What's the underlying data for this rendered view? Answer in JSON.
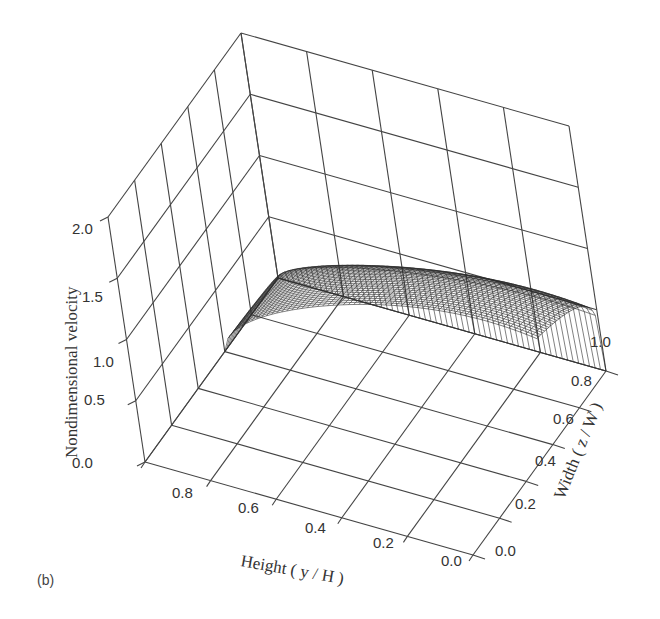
{
  "figure": {
    "panel_label": "(b)",
    "background": "#ffffff",
    "line_color": "#444444",
    "mesh_color": "#2b2b2b"
  },
  "axes": {
    "z": {
      "title": "Nondimensional velocity",
      "ticks": [
        "0.0",
        "0.5",
        "1.0",
        "1.5",
        "2.0"
      ]
    },
    "y": {
      "title": "Height ( y / H )",
      "ticks": [
        "0.8",
        "0.6",
        "0.4",
        "0.2",
        "0.0"
      ]
    },
    "x": {
      "title": "Width ( z / W )",
      "ticks": [
        "0.0",
        "0.2",
        "0.4",
        "0.6",
        "0.8",
        "1.0"
      ]
    }
  },
  "chart_data": {
    "type": "surface3d",
    "title": "",
    "panel_label": "(b)",
    "xlabel": "Height (y/H)",
    "ylabel": "Width (z/W)",
    "zlabel": "Nondimensional velocity",
    "xlim": [
      0.0,
      1.0
    ],
    "ylim": [
      0.0,
      1.0
    ],
    "zlim": [
      0.0,
      2.0
    ],
    "x_ticks": [
      0.0,
      0.2,
      0.4,
      0.6,
      0.8
    ],
    "y_ticks": [
      0.0,
      0.2,
      0.4,
      0.6,
      0.8,
      1.0
    ],
    "z_ticks": [
      0.0,
      0.5,
      1.0,
      1.5,
      2.0
    ],
    "grid": true,
    "surface_extent": {
      "height_range": [
        0.0,
        1.0
      ],
      "width_range": [
        0.6,
        1.0
      ]
    },
    "surface_description": "Wire-mesh velocity profile; velocity is zero at the wall (height = 1.0) and rises to a plateau of about 1.0-1.2 toward height 0; falls steeply to zero at width 1.0 (wall) and stays near 1.0 at width 0.6 (symmetry plane).",
    "sample_profile_along_height_at_width_0_6": {
      "height": [
        1.0,
        0.9,
        0.8,
        0.6,
        0.4,
        0.2,
        0.0
      ],
      "velocity": [
        0.0,
        0.45,
        0.75,
        1.0,
        1.1,
        1.15,
        1.15
      ]
    },
    "sample_profile_along_width_at_height_0_0": {
      "width": [
        0.6,
        0.7,
        0.8,
        0.9,
        0.95,
        1.0
      ],
      "velocity": [
        1.15,
        1.15,
        1.12,
        1.0,
        0.8,
        0.0
      ]
    }
  }
}
